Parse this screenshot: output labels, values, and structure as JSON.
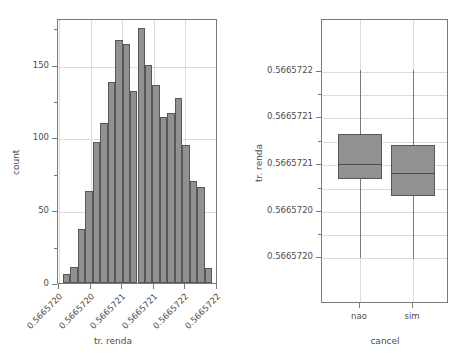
{
  "figure": {
    "background": "#ffffff",
    "bar_fill": "#919191",
    "bar_edge": "#575757",
    "grid_color": "#d9dce3",
    "axis_color": "#7a7a7a",
    "text_color": "#4d4d4d"
  },
  "chart_data": [
    {
      "type": "bar",
      "panel": "left",
      "title": "",
      "subtitle": "",
      "xlabel": "tr. renda",
      "ylabel": "count",
      "grid": true,
      "legend": "none",
      "ylim": [
        0,
        182
      ],
      "yticks": [
        0,
        50,
        100,
        150
      ],
      "ytick_labels": [
        "0",
        "50",
        "100",
        "150"
      ],
      "yminor_ticks": [
        25,
        75,
        125,
        175
      ],
      "xtick_labels": [
        "0.5665720",
        "0.5665720",
        "0.5665721",
        "0.5665721",
        "0.5665722",
        "0.5665722"
      ],
      "xtick_rotation": -45,
      "categories": [
        "b1",
        "b2",
        "b3",
        "b4",
        "b5",
        "b6",
        "b7",
        "b8",
        "b9",
        "b10",
        "b11",
        "b12",
        "b13",
        "b14",
        "b15",
        "b16",
        "b17",
        "b18",
        "b19",
        "b20",
        "b21"
      ],
      "values": [
        6,
        11,
        37,
        63,
        97,
        110,
        138,
        167,
        164,
        132,
        175,
        150,
        136,
        114,
        117,
        127,
        95,
        70,
        66,
        10
      ],
      "note": "histogram of tr. renda, 20 bins"
    },
    {
      "type": "box",
      "panel": "right",
      "title": "",
      "xlabel": "cancel",
      "ylabel": "tr. renda",
      "grid": true,
      "legend": "none",
      "ylim": [
        0.56657195,
        0.56657228
      ],
      "yticks": [
        "0.5665720",
        "0.5665720",
        "0.5665721",
        "0.5665721",
        "0.5665722"
      ],
      "ytick_labels": [
        "0.5665722",
        "0.5665721",
        "0.5665721",
        "0.5665720",
        "0.5665720"
      ],
      "categories": [
        "nao",
        "sim"
      ],
      "boxes": [
        {
          "name": "nao",
          "whisker_low": 0.566572003,
          "q1": 0.566572095,
          "median": 0.566572113,
          "q3": 0.566572147,
          "whisker_high": 0.566572222
        },
        {
          "name": "sim",
          "whisker_low": 0.566572002,
          "q1": 0.566572076,
          "median": 0.566572102,
          "q3": 0.566572135,
          "whisker_high": 0.566572222
        }
      ]
    }
  ]
}
